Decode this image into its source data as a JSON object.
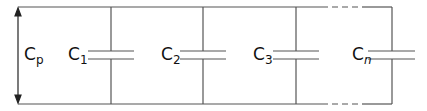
{
  "diagram": {
    "total_label": {
      "base": "C",
      "sub": "p"
    },
    "capacitors": [
      {
        "base": "C",
        "sub": "1"
      },
      {
        "base": "C",
        "sub": "2"
      },
      {
        "base": "C",
        "sub": "3"
      },
      {
        "base": "C",
        "sub": "n"
      }
    ],
    "colors": {
      "line": "#555555",
      "text": "#111111"
    }
  }
}
